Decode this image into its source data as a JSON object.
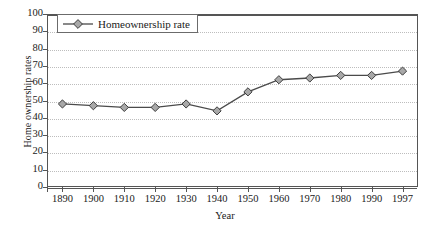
{
  "chart_data": {
    "type": "line",
    "title": "",
    "xlabel": "Year",
    "ylabel": "Home ownership rates",
    "categories": [
      "1890",
      "1900",
      "1910",
      "1920",
      "1930",
      "1940",
      "1950",
      "1960",
      "1970",
      "1980",
      "1990",
      "1997"
    ],
    "values": [
      48,
      47,
      46,
      46,
      48,
      44,
      55,
      62,
      63,
      64.5,
      64.5,
      67
    ],
    "series": [
      {
        "name": "Homeownership rate",
        "values": [
          48,
          47,
          46,
          46,
          48,
          44,
          55,
          62,
          63,
          64.5,
          64.5,
          67
        ]
      }
    ],
    "ylim": [
      0,
      100
    ],
    "ytick_step": 10,
    "yticks": [
      "100",
      "90",
      "80",
      "70",
      "60",
      "50",
      "40",
      "30",
      "20",
      "10",
      "0"
    ],
    "grid": true,
    "legend_position": "top-left",
    "legend": [
      "Homeownership rate"
    ],
    "marker": "diamond",
    "colors": {
      "line": "#4a4a4a",
      "marker_fill": "#a8a8a8",
      "marker_stroke": "#3d3d3d",
      "gridline": "#bdbdbd",
      "axis": "#555555",
      "text": "#1a1a1a",
      "background": "#ffffff"
    }
  },
  "axes": {
    "x_title": "Year",
    "y_title": "Home ownership rates"
  },
  "legend": {
    "label": "Homeownership rate"
  }
}
